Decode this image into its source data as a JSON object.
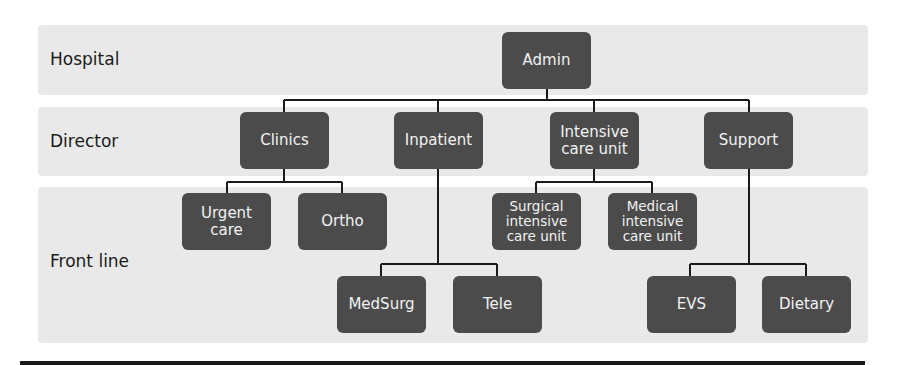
{
  "bands": [
    {
      "label": "Hospital"
    },
    {
      "label": "Director"
    },
    {
      "label": "Front line"
    }
  ],
  "nodes": {
    "admin": "Admin",
    "clinics": "Clinics",
    "inpatient": "Inpatient",
    "icu": "Intensive\ncare unit",
    "support": "Support",
    "urgent_care": "Urgent\ncare",
    "ortho": "Ortho",
    "surgical_icu": "Surgical\nintensive\ncare unit",
    "medical_icu": "Medical\nintensive\ncare unit",
    "medsurg": "MedSurg",
    "tele": "Tele",
    "evs": "EVS",
    "dietary": "Dietary"
  },
  "colors": {
    "band": "#e9e9e9",
    "node": "#4b4b4b",
    "node_text": "#f2f2f2",
    "connector": "#1a1a1a"
  }
}
